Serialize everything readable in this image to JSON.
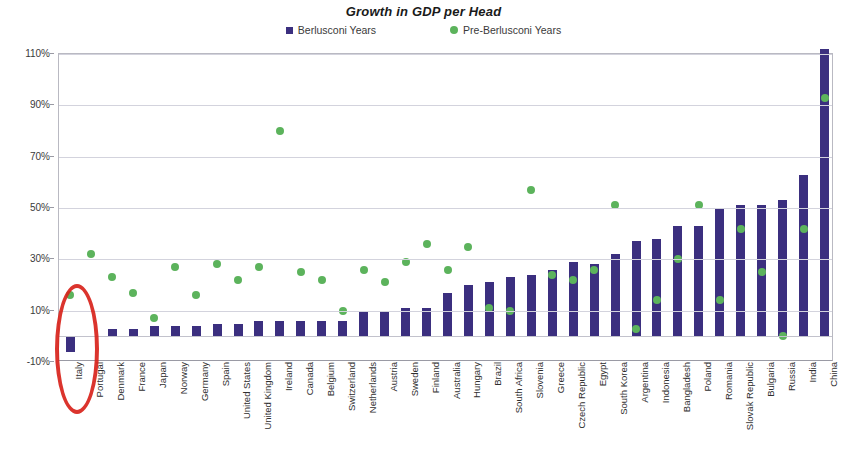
{
  "chart_data": {
    "type": "bar",
    "title": "Growth in GDP per Head",
    "xlabel": "",
    "ylabel": "",
    "ylim": [
      -10,
      110
    ],
    "yticks": [
      "-10%",
      "10%",
      "30%",
      "50%",
      "70%",
      "90%",
      "110%"
    ],
    "ytick_values": [
      -10,
      10,
      30,
      50,
      70,
      90,
      110
    ],
    "grid": true,
    "legend_position": "top-center",
    "categories": [
      "Italy",
      "Portugal",
      "Denmark",
      "France",
      "Japan",
      "Norway",
      "Germany",
      "Spain",
      "United States",
      "United Kingdom",
      "Ireland",
      "Canada",
      "Belgium",
      "Switzerland",
      "Netherlands",
      "Austria",
      "Sweden",
      "Finland",
      "Australia",
      "Hungary",
      "Brazil",
      "South Africa",
      "Slovenia",
      "Greece",
      "Czech Republic",
      "Egypt",
      "South Korea",
      "Argentina",
      "Indonesia",
      "Bangladesh",
      "Poland",
      "Romania",
      "Slovak Republic",
      "Bulgaria",
      "Russia",
      "India",
      "China"
    ],
    "series": [
      {
        "name": "Berlusconi Years",
        "type": "bar",
        "color": "#3b2f7f",
        "values": [
          -6,
          0,
          3,
          3,
          4,
          4,
          4,
          5,
          5,
          6,
          6,
          6,
          6,
          6,
          10,
          10,
          11,
          11,
          17,
          20,
          21,
          23,
          24,
          26,
          29,
          28,
          32,
          37,
          38,
          43,
          43,
          50,
          51,
          51,
          53,
          63,
          112
        ]
      },
      {
        "name": "Pre-Berlusconi Years",
        "type": "scatter",
        "color": "#5cb35c",
        "values": [
          16,
          32,
          23,
          17,
          7,
          27,
          16,
          28,
          22,
          27,
          80,
          25,
          22,
          10,
          26,
          21,
          29,
          36,
          26,
          35,
          11,
          10,
          57,
          24,
          22,
          26,
          51,
          3,
          14,
          30,
          51,
          14,
          42,
          25,
          0,
          42,
          93
        ]
      }
    ],
    "annotations": [
      {
        "name": "italy-highlight-ellipse",
        "shape": "ellipse",
        "color": "#d8231b",
        "target": "Italy"
      }
    ]
  },
  "legend": {
    "items": [
      {
        "label": "Berlusconi Years",
        "marker": "square",
        "color": "#3b2f7f"
      },
      {
        "label": "Pre-Berlusconi Years",
        "marker": "circle",
        "color": "#5cb35c"
      }
    ]
  },
  "footer": {
    "fragment": ""
  }
}
